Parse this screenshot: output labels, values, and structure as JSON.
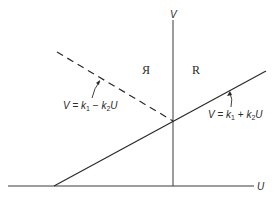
{
  "diagram": {
    "axes": {
      "x_label": "U",
      "y_label": "V"
    },
    "regions": [
      {
        "label": "Я"
      },
      {
        "label": "R"
      }
    ],
    "lines": [
      {
        "name": "solid-line",
        "style": "solid",
        "equation": {
          "lhs": "V",
          "eq": " = ",
          "k1": "k",
          "k1_sub": "1",
          "op": " + ",
          "k2": "k",
          "k2_sub": "2",
          "var": "U"
        }
      },
      {
        "name": "dashed-line",
        "style": "dashed",
        "equation": {
          "lhs": "V",
          "eq": " = ",
          "k1": "k",
          "k1_sub": "1",
          "op": " − ",
          "k2": "k",
          "k2_sub": "2",
          "var": "U"
        }
      }
    ],
    "colors": {
      "ink": "#2a2a2a",
      "background": "#ffffff"
    }
  }
}
